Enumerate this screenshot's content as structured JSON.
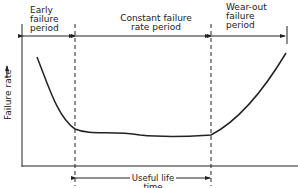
{
  "diagram": {
    "type": "bathtub-curve",
    "y_axis_label": "Failure rate",
    "periods": [
      {
        "label": "Early\nfailure\nperiod"
      },
      {
        "label": "Constant failure\nrate period"
      },
      {
        "label": "Wear-out\nfailure\nperiod"
      }
    ],
    "useful_life_label": "Useful life time"
  }
}
